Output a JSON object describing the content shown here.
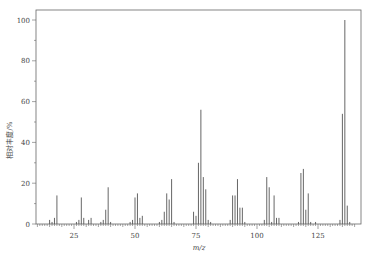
{
  "chart_data": {
    "type": "bar",
    "title": "",
    "xlabel": "m/z",
    "ylabel": "相对丰度/%",
    "xlim": [
      10,
      140
    ],
    "ylim": [
      0,
      100
    ],
    "xticks": [
      25,
      50,
      75,
      100,
      125
    ],
    "yticks": [
      0,
      20,
      40,
      60,
      80,
      100
    ],
    "grid": false,
    "legend": null,
    "x": [
      15,
      16,
      17,
      18,
      26,
      27,
      28,
      29,
      31,
      32,
      36,
      37,
      38,
      39,
      40,
      48,
      49,
      50,
      51,
      52,
      53,
      60,
      61,
      62,
      63,
      64,
      65,
      66,
      74,
      75,
      76,
      77,
      78,
      79,
      80,
      81,
      89,
      90,
      91,
      92,
      93,
      94,
      95,
      103,
      104,
      105,
      106,
      107,
      108,
      109,
      117,
      118,
      119,
      120,
      121,
      122,
      124,
      134,
      135,
      136,
      137,
      138
    ],
    "values": [
      2,
      1,
      3,
      14,
      1,
      2,
      13,
      3,
      2,
      3,
      1,
      2,
      7,
      18,
      1,
      1,
      2,
      13,
      15,
      3,
      4,
      1,
      2,
      6,
      15,
      12,
      22,
      1,
      6,
      4,
      30,
      56,
      23,
      17,
      2,
      1,
      2,
      14,
      14,
      22,
      8,
      8,
      1,
      2,
      23,
      18,
      1,
      14,
      3,
      3,
      1,
      25,
      27,
      7,
      15,
      1,
      1,
      2,
      54,
      100,
      9,
      1
    ]
  },
  "axes": {
    "xlabel": "m/z",
    "ylabel": "相对丰度/%",
    "xtick_labels": [
      "25",
      "50",
      "75",
      "100",
      "125"
    ],
    "ytick_labels": [
      "0",
      "20",
      "40",
      "60",
      "80",
      "100"
    ]
  }
}
